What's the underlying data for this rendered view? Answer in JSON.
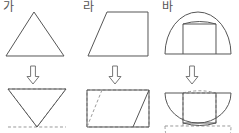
{
  "sheet": {
    "title": "Figure transformation worksheet",
    "background_color": "#ffffff",
    "solid_line_color": "#555555",
    "dashed_line_color": "#9a9a9a",
    "arrow_icon_name": "down-block-arrow"
  },
  "columns": [
    {
      "label": "가",
      "top_shape_name": "triangle",
      "bottom_shape_name": "triangle-with-dashed-inverted-copy",
      "arrow_symbol": "⇩"
    },
    {
      "label": "라",
      "top_shape_name": "trapezoid",
      "bottom_shape_name": "rectangle-with-dashed-parallelogram",
      "arrow_symbol": "⇩"
    },
    {
      "label": "바",
      "top_shape_name": "semicircle-with-inscribed-rectangle",
      "bottom_shape_name": "ellipse-with-dashed-mirrored-copy",
      "arrow_symbol": "⇩"
    }
  ]
}
